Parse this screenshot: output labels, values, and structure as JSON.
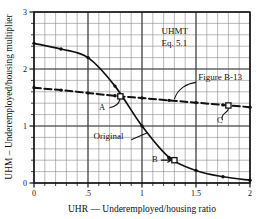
{
  "chart_data": {
    "type": "line",
    "title": "",
    "xlabel": "UHR — Underemployed/housing ratio",
    "ylabel": "UHM – Underemployed/housing multiplier",
    "xlim": [
      0,
      2
    ],
    "ylim": [
      0,
      3
    ],
    "xticks": [
      0,
      0.5,
      1,
      1.5,
      2
    ],
    "xticklabels": [
      "0",
      ".5",
      "1",
      "1.5",
      "2"
    ],
    "yticks": [
      0,
      1,
      2,
      3
    ],
    "yticklabels": [
      "0",
      "1",
      "2",
      "3"
    ],
    "x_minor_step": 0.1,
    "y_minor_step": 0.2,
    "grid": true,
    "legend_position": "inline-annotations",
    "series": [
      {
        "name": "Original",
        "style": "solid",
        "x": [
          0.0,
          0.25,
          0.5,
          0.75,
          1.0,
          1.25,
          1.5,
          1.75,
          2.0
        ],
        "values": [
          2.45,
          2.35,
          2.2,
          1.7,
          1.0,
          0.45,
          0.22,
          0.11,
          0.05
        ]
      },
      {
        "name": "Figure B-13",
        "style": "dashed",
        "x": [
          0.0,
          0.25,
          0.5,
          0.75,
          1.0,
          1.25,
          1.5,
          1.75,
          2.0
        ],
        "values": [
          1.67,
          1.63,
          1.58,
          1.53,
          1.49,
          1.45,
          1.41,
          1.37,
          1.33
        ]
      }
    ],
    "annotations": [
      {
        "name": "UHMT",
        "text": "UHMT",
        "x": 1.18,
        "y": 2.62
      },
      {
        "name": "equation",
        "text": "Eq. 5.1",
        "x": 1.18,
        "y": 2.4
      },
      {
        "name": "figure-b13",
        "text": "Figure B-13",
        "x": 1.52,
        "y": 1.8
      },
      {
        "name": "original",
        "text": "Original",
        "x": 0.55,
        "y": 0.78
      }
    ],
    "points": [
      {
        "label": "A",
        "x": 0.8,
        "y": 1.52,
        "label_x": 0.63,
        "label_y": 1.28,
        "marker": "open-square"
      },
      {
        "label": "B",
        "x": 1.3,
        "y": 0.4,
        "label_x": 1.12,
        "label_y": 0.37,
        "marker": "open-square"
      },
      {
        "label": "C",
        "x": 1.8,
        "y": 1.36,
        "label_x": 1.72,
        "label_y": 1.05,
        "marker": "open-square"
      }
    ],
    "colors": {
      "curve": "#111111",
      "grid_minor": "#8a8a8a",
      "grid_major": "#3a3a3a",
      "frame": "#111111",
      "background": "#ffffff",
      "text": "#111111"
    }
  }
}
